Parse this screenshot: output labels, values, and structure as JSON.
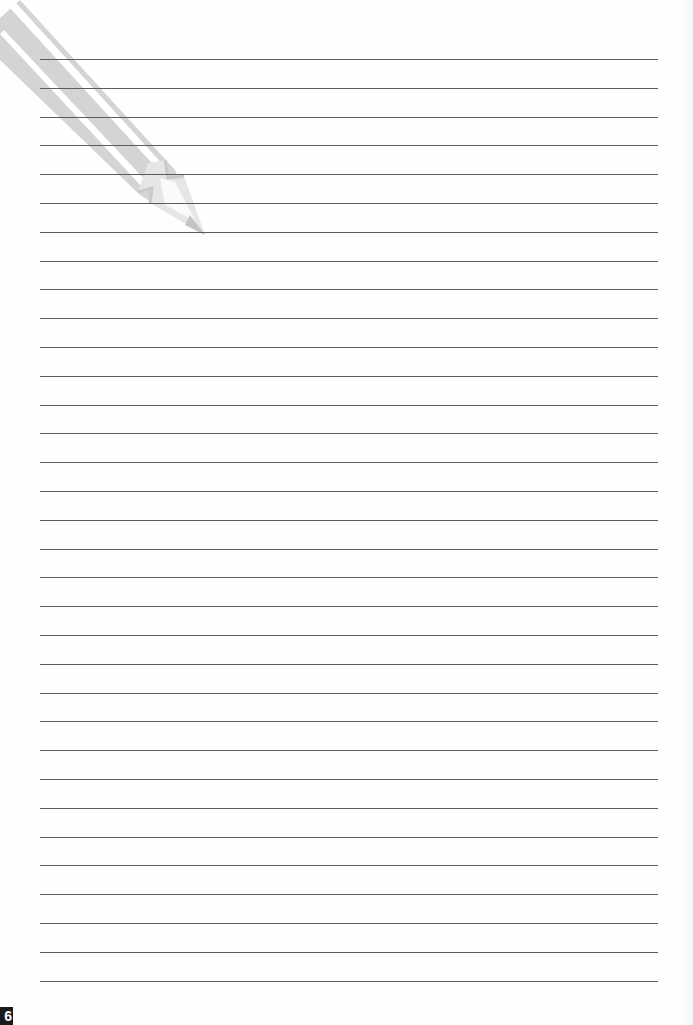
{
  "page": {
    "type": "lined-notebook-page",
    "background_color": "#fefefe",
    "line_color": "#5c5c5c",
    "pencil_color": "#d2d2d2",
    "line_count": 33,
    "line_start_y": 59,
    "line_spacing": 28.8,
    "page_number": "6"
  }
}
